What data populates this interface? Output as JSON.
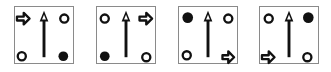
{
  "diagram": {
    "colors": {
      "ink": "#111111",
      "border": "#8a8a8a",
      "background": "#ffffff"
    },
    "panels": [
      {
        "index": 1,
        "center": "up-arrow",
        "top_left": "right-block-arrow",
        "top_right": "hollow-circle",
        "bottom_left": "hollow-circle",
        "bottom_right": "filled-circle"
      },
      {
        "index": 2,
        "center": "up-arrow",
        "top_left": "hollow-circle",
        "top_right": "right-block-arrow",
        "bottom_left": "filled-circle",
        "bottom_right": "hollow-circle"
      },
      {
        "index": 3,
        "center": "up-arrow",
        "top_left": "filled-circle",
        "top_right": "hollow-circle",
        "bottom_left": "hollow-circle",
        "bottom_right": "right-block-arrow"
      },
      {
        "index": 4,
        "center": "up-arrow",
        "top_left": "hollow-circle",
        "top_right": "filled-circle",
        "bottom_left": "right-block-arrow",
        "bottom_right": "hollow-circle"
      }
    ]
  }
}
